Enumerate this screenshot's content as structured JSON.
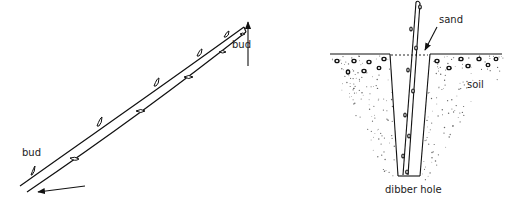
{
  "figure": {
    "left_panel": {
      "description": "hardwood cutting showing buds along stem with arrows indicating orientation",
      "labels": {
        "bud_top": "bud",
        "bud_bottom": "bud"
      }
    },
    "right_panel": {
      "description": "cutting inserted into dibber hole filled with sand in soil",
      "labels": {
        "sand": "sand",
        "soil": "soil",
        "dibber_hole": "dibber hole"
      }
    },
    "colors": {
      "ink": "#111111",
      "stipple": "#555555",
      "background": "#ffffff"
    }
  }
}
